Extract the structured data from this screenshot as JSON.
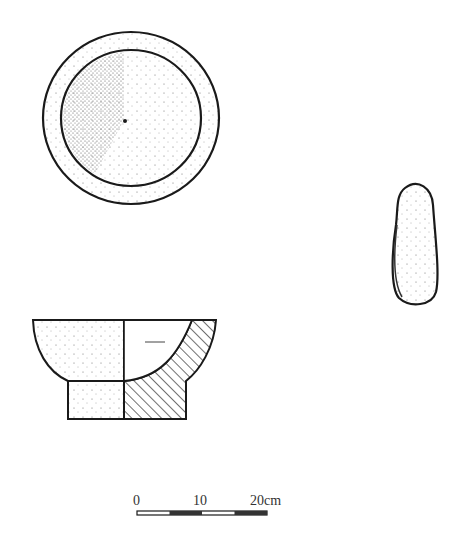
{
  "figure": {
    "type": "archaeological line drawing",
    "objects": [
      {
        "name": "mortar",
        "views": [
          "top view",
          "side elevation / section"
        ]
      },
      {
        "name": "pestle",
        "views": [
          "side view"
        ]
      }
    ]
  },
  "scale_bar": {
    "labels": [
      "0",
      "10",
      "20cm"
    ],
    "segments": 4,
    "unit": "cm",
    "max_value": 20
  },
  "colors": {
    "ink": "#1a1a1a",
    "background": "#ffffff"
  }
}
